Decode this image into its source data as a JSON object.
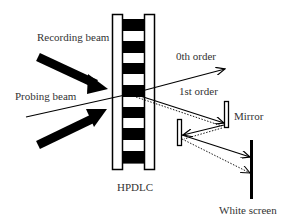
{
  "diagram": {
    "type": "optical-setup",
    "colors": {
      "background": "#ffffff",
      "stroke": "#000000",
      "text": "#333333"
    },
    "labels": {
      "recording_beam": "Recording beam",
      "probing_beam": "Probing beam",
      "zeroth_order": "0th order",
      "first_order": "1st order",
      "mirror": "Mirror",
      "hpdlc": "HPDLC",
      "white_screen": "White screen"
    },
    "components": [
      {
        "id": "recording-beam-upper",
        "kind": "thick-arrow"
      },
      {
        "id": "recording-beam-lower",
        "kind": "thick-arrow"
      },
      {
        "id": "probing-beam",
        "kind": "line"
      },
      {
        "id": "hpdlc-grating",
        "kind": "grating",
        "black_stripes": 7
      },
      {
        "id": "zeroth-order-beam",
        "kind": "arrow"
      },
      {
        "id": "first-order-beam",
        "kind": "arrow-with-dotted"
      },
      {
        "id": "mirror-1",
        "kind": "mirror"
      },
      {
        "id": "mirror-2",
        "kind": "mirror"
      },
      {
        "id": "white-screen",
        "kind": "screen"
      }
    ]
  }
}
